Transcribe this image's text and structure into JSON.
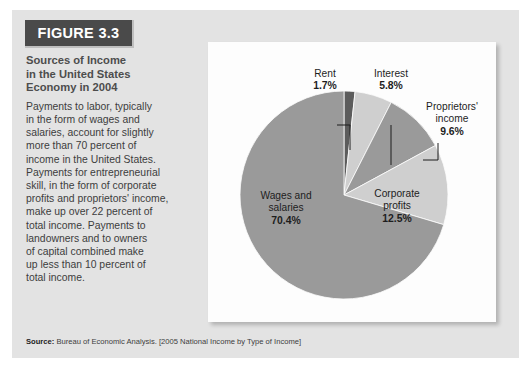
{
  "figure": {
    "banner_label": "FIGURE 3.3",
    "title": "Sources of Income\nin the United States\nEconomy in 2004",
    "body": "Payments to labor, typically\nin the form of wages and\nsalaries, account for slightly\nmore than 70 percent of\nincome in the United States.\nPayments for entrepreneurial\nskill, in the form of corporate\nprofits and proprietors' income,\nmake up over 22 percent of\ntotal income. Payments to\nlandowners and to owners\nof capital combined make\nup less than 10 percent of\ntotal income.",
    "source_label": "Source:",
    "source_text": " Bureau of Economic Analysis. [2005 National Income by Type of Income]"
  },
  "colors": {
    "panel_background": "#e3e3e3",
    "banner_background": "#4a4a4a",
    "banner_text": "#ffffff",
    "card_background": "#fdfdfd",
    "title_text": "#4d4d4d",
    "body_text": "#3d3d3d",
    "slice_dark": "#5c5c5c",
    "slice_light": "#cfcfcf",
    "slice_medium": "#9a9a9a",
    "label_text": "#1d1d1d"
  },
  "chart_data": {
    "type": "pie",
    "title": "Sources of Income in the United States Economy in 2004",
    "categories": [
      "Rent",
      "Interest",
      "Proprietors' income",
      "Corporate profits",
      "Wages and salaries"
    ],
    "values": [
      1.7,
      5.8,
      9.6,
      12.5,
      70.4
    ],
    "unit": "percent",
    "legend": "none",
    "start_angle_deg": -90,
    "direction": "clockwise",
    "slices": [
      {
        "label": "Rent",
        "value": 1.7,
        "pct_text": "1.7%",
        "color": "#5c5c5c",
        "label_placement": "callout"
      },
      {
        "label": "Interest",
        "value": 5.8,
        "pct_text": "5.8%",
        "color": "#cfcfcf",
        "label_placement": "callout"
      },
      {
        "label": "Proprietors'\nincome",
        "value": 9.6,
        "pct_text": "9.6%",
        "color": "#9a9a9a",
        "label_placement": "callout"
      },
      {
        "label": "Corporate\nprofits",
        "value": 12.5,
        "pct_text": "12.5%",
        "color": "#cfcfcf",
        "label_placement": "inside"
      },
      {
        "label": "Wages and\nsalaries",
        "value": 70.4,
        "pct_text": "70.4%",
        "color": "#9a9a9a",
        "label_placement": "inside"
      }
    ]
  },
  "labels": {
    "rent_name": "Rent",
    "rent_pct": "1.7%",
    "interest_name": "Interest",
    "interest_pct": "5.8%",
    "proprietors_name1": "Proprietors'",
    "proprietors_name2": "income",
    "proprietors_pct": "9.6%",
    "corporate_name1": "Corporate",
    "corporate_name2": "profits",
    "corporate_pct": "12.5%",
    "wages_name1": "Wages and",
    "wages_name2": "salaries",
    "wages_pct": "70.4%"
  }
}
